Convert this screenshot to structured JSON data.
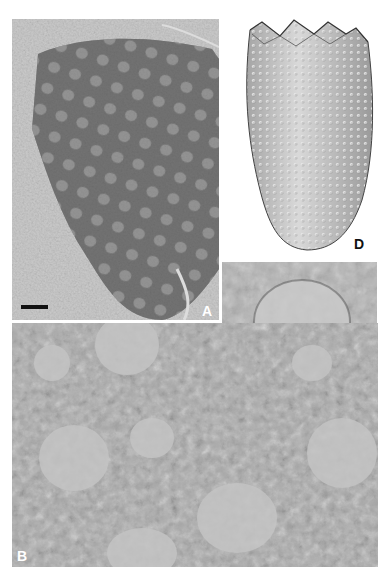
{
  "figure": {
    "panels": [
      {
        "id": "A",
        "label": "A",
        "description": "Fossil specimen, dark reticulate body with scattered pale circular pores",
        "label_color": "#ffffff"
      },
      {
        "id": "B",
        "label": "B",
        "description": "Enlarged detail of surface texture showing pale rounded pores in dark reticulate matrix",
        "label_color": "#ffffff"
      },
      {
        "id": "C",
        "label": "C",
        "description": "Close-up of single pale pore with surrounding reticulate network",
        "label_color": "#111111"
      },
      {
        "id": "D",
        "label": "D",
        "description": "Reconstruction drawing of elongated conical body with zigzag crenulated aperture and dense nodular ornament",
        "label_color": "#111111"
      }
    ],
    "scale_bar": {
      "panel": "A",
      "color": "#111111"
    },
    "colors": {
      "background": "#ffffff",
      "matrix_light": "#c8c8c8",
      "fossil_dark": "#6e6e6e",
      "pore_light": "#bdbdbd",
      "drawing_fill": "#d2d2d2"
    }
  }
}
